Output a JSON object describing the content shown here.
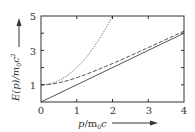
{
  "chart_data": {
    "type": "line",
    "title": "",
    "xlabel": "p/m₀c",
    "ylabel": "E(p)/m₀c²",
    "xlim": [
      0,
      4
    ],
    "ylim": [
      0,
      5
    ],
    "x_ticks": [
      "0",
      "1",
      "2",
      "3",
      "4"
    ],
    "y_ticks": [
      "0",
      "1",
      "3",
      "5"
    ],
    "y_minor_ticks": [
      2,
      4
    ],
    "grid": false,
    "legend": null,
    "series": [
      {
        "name": "E = p c (ultra-relativistic)",
        "style": "solid",
        "formula": "p",
        "x": [
          0,
          1,
          2,
          3,
          4
        ],
        "values": [
          0,
          1,
          2,
          3,
          4
        ]
      },
      {
        "name": "E = sqrt(1 + p^2) (relativistic)",
        "style": "dashed",
        "formula": "sqrt(1+p^2)",
        "x": [
          0,
          1,
          2,
          3,
          4
        ],
        "values": [
          1.0,
          1.41,
          2.24,
          3.16,
          4.12
        ]
      },
      {
        "name": "E = 1 + p^2 (non-relativistic)",
        "style": "dotted",
        "formula": "1+p^2",
        "x": [
          0,
          0.5,
          1,
          1.5,
          2
        ],
        "values": [
          1.0,
          1.25,
          2.0,
          3.25,
          5.0
        ]
      }
    ]
  },
  "labels": {
    "xlabel_p": "p",
    "xlabel_rest": "/m",
    "xlabel_sub": "0",
    "xlabel_c": "c",
    "ylabel_main": "E(p)/m",
    "ylabel_sub": "0",
    "ylabel_c": "c",
    "ylabel_sup": "2"
  }
}
